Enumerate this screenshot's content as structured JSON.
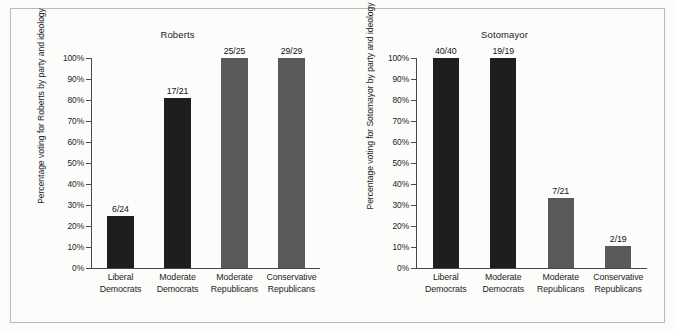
{
  "figure": {
    "background_color": "#fbfbfa",
    "border_color": "#b9b9b9",
    "dem_color": "#1e1e1e",
    "rep_color": "#595959"
  },
  "chart_data": [
    {
      "type": "bar",
      "title": "Roberts",
      "xlabel": "",
      "ylabel": "Percentage voting for Roberts by party and ideology",
      "ylim": [
        0,
        100
      ],
      "grid": false,
      "legend": "none",
      "ytick_labels": [
        "100%",
        "90%",
        "80%",
        "70%",
        "60%",
        "50%",
        "40%",
        "30%",
        "20%",
        "10%",
        "0%"
      ],
      "ytick_values": [
        100,
        90,
        80,
        70,
        60,
        50,
        40,
        30,
        20,
        10,
        0
      ],
      "categories": [
        "Liberal Democrats",
        "Moderate Democrats",
        "Moderate Republicans",
        "Conservative Republicans"
      ],
      "category_lines": [
        [
          "Liberal",
          "Democrats"
        ],
        [
          "Moderate",
          "Democrats"
        ],
        [
          "Moderate",
          "Republicans"
        ],
        [
          "Conservative",
          "Republicans"
        ]
      ],
      "values": [
        25.0,
        81.0,
        100.0,
        100.0
      ],
      "data_labels": [
        "6/24",
        "17/21",
        "25/25",
        "29/29"
      ],
      "bar_groups": [
        "dem",
        "dem",
        "rep",
        "rep"
      ]
    },
    {
      "type": "bar",
      "title": "Sotomayor",
      "xlabel": "",
      "ylabel": "Percentage voting for Sotomayor by party and ideology",
      "ylim": [
        0,
        100
      ],
      "grid": false,
      "legend": "none",
      "ytick_labels": [
        "100%",
        "90%",
        "80%",
        "70%",
        "60%",
        "50%",
        "40%",
        "30%",
        "20%",
        "10%",
        "0%"
      ],
      "ytick_values": [
        100,
        90,
        80,
        70,
        60,
        50,
        40,
        30,
        20,
        10,
        0
      ],
      "categories": [
        "Liberal Democrats",
        "Moderate Democrats",
        "Moderate Republicans",
        "Conservative Republicans"
      ],
      "category_lines": [
        [
          "Liberal",
          "Democrats"
        ],
        [
          "Moderate",
          "Democrats"
        ],
        [
          "Moderate",
          "Republicans"
        ],
        [
          "Conservative",
          "Republicans"
        ]
      ],
      "values": [
        100.0,
        100.0,
        33.3,
        10.5
      ],
      "data_labels": [
        "40/40",
        "19/19",
        "7/21",
        "2/19"
      ],
      "bar_groups": [
        "dem",
        "dem",
        "rep",
        "rep"
      ]
    }
  ]
}
